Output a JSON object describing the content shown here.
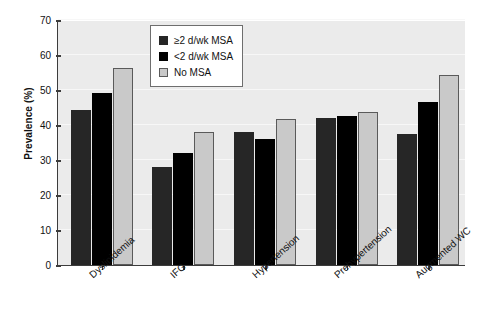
{
  "chart_data": {
    "type": "bar",
    "title": "",
    "xlabel": "",
    "ylabel": "Prevalence (%)",
    "ylim": [
      0,
      70
    ],
    "yticks": [
      0,
      10,
      20,
      30,
      40,
      50,
      60,
      70
    ],
    "grid": true,
    "legend_position": "top-center",
    "categories": [
      "Dyslipidemia",
      "IFG",
      "Hypertension",
      "Prehypertension",
      "Augmented WC"
    ],
    "series": [
      {
        "name": "≥2 d/wk MSA",
        "color": "#262626",
        "values": [
          44.2,
          28.1,
          38.0,
          42.0,
          37.5
        ]
      },
      {
        "name": "<2 d/wk MSA",
        "color": "#000000",
        "values": [
          49.2,
          32.1,
          36.0,
          42.5,
          46.5
        ]
      },
      {
        "name": "No MSA",
        "color": "#c9c9c9",
        "values": [
          56.2,
          38.0,
          41.6,
          43.6,
          54.3
        ]
      }
    ]
  },
  "legend": {
    "items": [
      {
        "label": "≥2 d/wk MSA",
        "swatch": "dark-gray-swatch"
      },
      {
        "label": "<2 d/wk MSA",
        "swatch": "black-swatch"
      },
      {
        "label": "No MSA",
        "swatch": "light-gray-swatch"
      }
    ]
  },
  "axes": {
    "y_title": "Prevalence (%)",
    "y_tick_labels": [
      "70",
      "60",
      "50",
      "40",
      "30",
      "20",
      "10",
      "0"
    ],
    "x_tick_labels": [
      "Dyslipidemia",
      "IFG",
      "Hypertension",
      "Prehypertension",
      "Augmented WC"
    ]
  }
}
